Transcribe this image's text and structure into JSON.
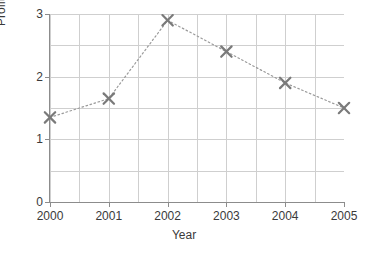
{
  "chart_data": {
    "type": "line",
    "title": "",
    "xlabel": "Year",
    "ylabel": "Profit (£m)",
    "categories": [
      "2000",
      "2001",
      "2002",
      "2003",
      "2004",
      "2005"
    ],
    "x": [
      2000,
      2001,
      2002,
      2003,
      2004,
      2005
    ],
    "values": [
      1.35,
      1.65,
      2.9,
      2.4,
      1.9,
      1.5
    ],
    "series": [
      {
        "name": "Profit",
        "values": [
          1.35,
          1.65,
          2.9,
          2.4,
          1.9,
          1.5
        ]
      }
    ],
    "xlim": [
      2000,
      2005
    ],
    "ylim": [
      0,
      3
    ],
    "ytick_labels": [
      "0",
      "1",
      "2",
      "3"
    ],
    "ytick_values": [
      0,
      1,
      2,
      3
    ],
    "xtick_labels": [
      "2000",
      "2001",
      "2002",
      "2003",
      "2004",
      "2005"
    ],
    "grid": true,
    "grid_y_step": 0.5,
    "grid_x_step": 0.5,
    "legend": false,
    "legend_position": "none",
    "marker": "x",
    "line_style": "dotted",
    "colors": {
      "marker": "#7a7a7a",
      "line": "#9a9a9a",
      "grid": "#cfcfcf",
      "axis": "#8c8c8c",
      "text": "#3a3a3a",
      "background": "#ffffff"
    }
  },
  "axes": {
    "y_title": "Profit (£m)",
    "x_title": "Year",
    "y_ticks": [
      "3",
      "2",
      "1",
      "0"
    ],
    "x_ticks": [
      "2000",
      "2001",
      "2002",
      "2003",
      "2004",
      "2005"
    ]
  },
  "points": [
    {
      "year": "2000",
      "value": "1.35"
    },
    {
      "year": "2001",
      "value": "1.65"
    },
    {
      "year": "2002",
      "value": "2.9"
    },
    {
      "year": "2003",
      "value": "2.4"
    },
    {
      "year": "2004",
      "value": "1.9"
    },
    {
      "year": "2005",
      "value": "1.5"
    }
  ]
}
